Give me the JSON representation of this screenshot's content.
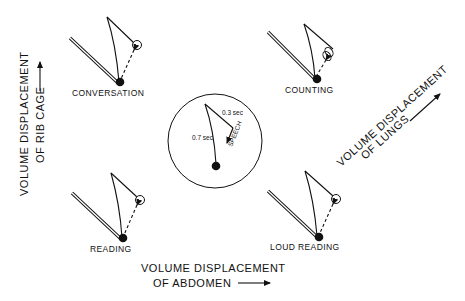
{
  "figure": {
    "axes": {
      "rib_cage": {
        "line1": "VOLUME DISPLACEMENT",
        "line2": "OF RIB CAGE"
      },
      "abdomen": {
        "line1": "VOLUME DISPLACEMENT",
        "line2": "OF ABDOMEN"
      },
      "lungs": {
        "line1": "VOLUME DISPLACEMENT",
        "line2": "OF LUNGS"
      }
    },
    "panels": [
      {
        "label": "CONVERSATION"
      },
      {
        "label": "COUNTING"
      },
      {
        "label": "READING"
      },
      {
        "label": "LOUD READING"
      }
    ],
    "legend": {
      "inspiration_time": "0.7 sec",
      "expiration_time": "0.3 sec",
      "speech_label": "SPEECH"
    }
  }
}
